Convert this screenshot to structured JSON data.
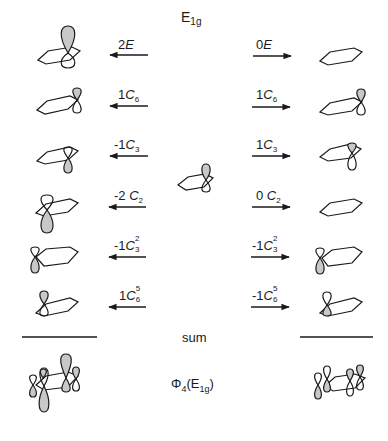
{
  "diagram": {
    "title": {
      "main": "E",
      "sub": "1g"
    },
    "orbital_colors": {
      "shaded": "#c8c8c8",
      "stroke": "#1a1a1a",
      "background": "#ffffff"
    },
    "central_orbital": "p-orbital-on-benzene-carbon",
    "left_column": {
      "direction": "left",
      "rows": [
        {
          "coef": "2",
          "op": "E",
          "sup": "",
          "sub": ""
        },
        {
          "coef": "1",
          "op": "C",
          "sup": "",
          "sub": "6"
        },
        {
          "coef": "-1",
          "op": "C",
          "sup": "",
          "sub": "3"
        },
        {
          "coef": "-2 ",
          "op": "C",
          "sup": "",
          "sub": "2"
        },
        {
          "coef": "-1",
          "op": "C",
          "sup": "2",
          "sub": "3"
        },
        {
          "coef": "1",
          "op": "C",
          "sup": "5",
          "sub": "6"
        }
      ]
    },
    "right_column": {
      "direction": "right",
      "rows": [
        {
          "coef": "0",
          "op": "E",
          "sup": "",
          "sub": ""
        },
        {
          "coef": "1",
          "op": "C",
          "sup": "",
          "sub": "6"
        },
        {
          "coef": "1",
          "op": "C",
          "sup": "",
          "sub": "3"
        },
        {
          "coef": "0 ",
          "op": "C",
          "sup": "",
          "sub": "2"
        },
        {
          "coef": "-1",
          "op": "C",
          "sup": "2",
          "sub": "3"
        },
        {
          "coef": "-1",
          "op": "C",
          "sup": "5",
          "sub": "6"
        }
      ]
    },
    "sum_label": "sum",
    "result_label": {
      "phi": "Φ",
      "phi_sub": "4",
      "paren_open": "(",
      "irrep": "E",
      "irrep_sub": "1g",
      "paren_close": ")"
    }
  }
}
